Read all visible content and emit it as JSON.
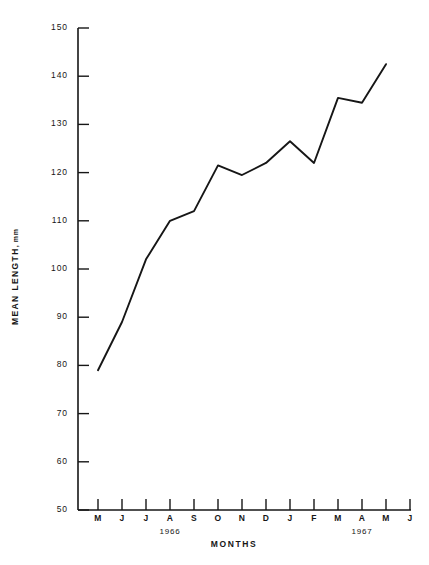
{
  "chart_data": {
    "type": "line",
    "title": "",
    "xlabel": "MONTHS",
    "ylabel": "MEAN LENGTH",
    "ylabel_unit": "mm",
    "ylim": [
      50,
      150
    ],
    "yticks": [
      150,
      140,
      130,
      120,
      110,
      100,
      90,
      80,
      70,
      60,
      50
    ],
    "grid": false,
    "legend": null,
    "categories": [
      "M",
      "J",
      "J",
      "A",
      "S",
      "O",
      "N",
      "D",
      "J",
      "F",
      "M",
      "A",
      "M",
      "J"
    ],
    "group_labels": [
      {
        "text": "1966",
        "at_category_index": 3
      },
      {
        "text": "1967",
        "at_category_index": 11
      }
    ],
    "series": [
      {
        "name": "mean length",
        "color": "#161616",
        "points": [
          {
            "x": "M",
            "y": 79
          },
          {
            "x": "J",
            "y": 89
          },
          {
            "x": "J",
            "y": 102
          },
          {
            "x": "A",
            "y": 110
          },
          {
            "x": "S",
            "y": 112
          },
          {
            "x": "O",
            "y": 121.5
          },
          {
            "x": "N",
            "y": 119.5
          },
          {
            "x": "D",
            "y": 122
          },
          {
            "x": "J",
            "y": 126.5
          },
          {
            "x": "F",
            "y": 122
          },
          {
            "x": "M",
            "y": 135.5
          },
          {
            "x": "A",
            "y": 134.5
          },
          {
            "x": "M",
            "y": 142.5
          }
        ]
      }
    ]
  },
  "axis": {
    "y_title_text": "MEAN LENGTH",
    "y_title_unit": ", mm",
    "x_title_text": "MONTHS"
  }
}
